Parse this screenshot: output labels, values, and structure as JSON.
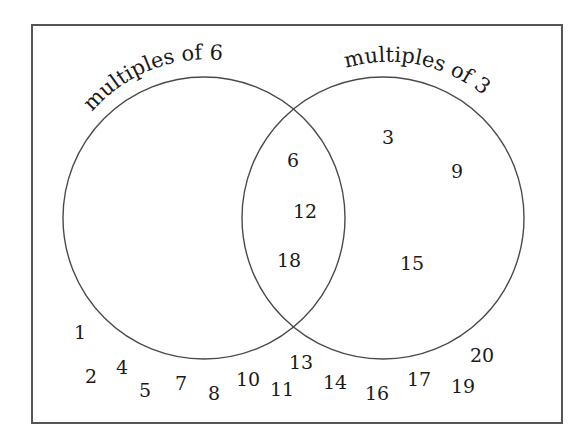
{
  "diagram": {
    "type": "venn",
    "universe": "whole numbers 1 to 20",
    "sets": [
      {
        "id": "A",
        "label": "multiples of 6",
        "only": [],
        "color": "#4a4a4a"
      },
      {
        "id": "B",
        "label": "multiples of 3",
        "only": [
          "3",
          "9",
          "15"
        ],
        "color": "#4a4a4a"
      }
    ],
    "intersection": [
      "6",
      "12",
      "18"
    ],
    "outside": [
      "1",
      "2",
      "4",
      "5",
      "7",
      "8",
      "10",
      "11",
      "13",
      "14",
      "16",
      "17",
      "19",
      "20"
    ]
  },
  "labels": {
    "left_circle": "multiples of 6",
    "right_circle": "multiples of 3"
  },
  "numbers": {
    "n6": "6",
    "n12": "12",
    "n18": "18",
    "n3": "3",
    "n9": "9",
    "n15": "15",
    "n1": "1",
    "n2": "2",
    "n4": "4",
    "n5": "5",
    "n7": "7",
    "n8": "8",
    "n10": "10",
    "n11": "11",
    "n13": "13",
    "n14": "14",
    "n16": "16",
    "n17": "17",
    "n19": "19",
    "n20": "20"
  }
}
